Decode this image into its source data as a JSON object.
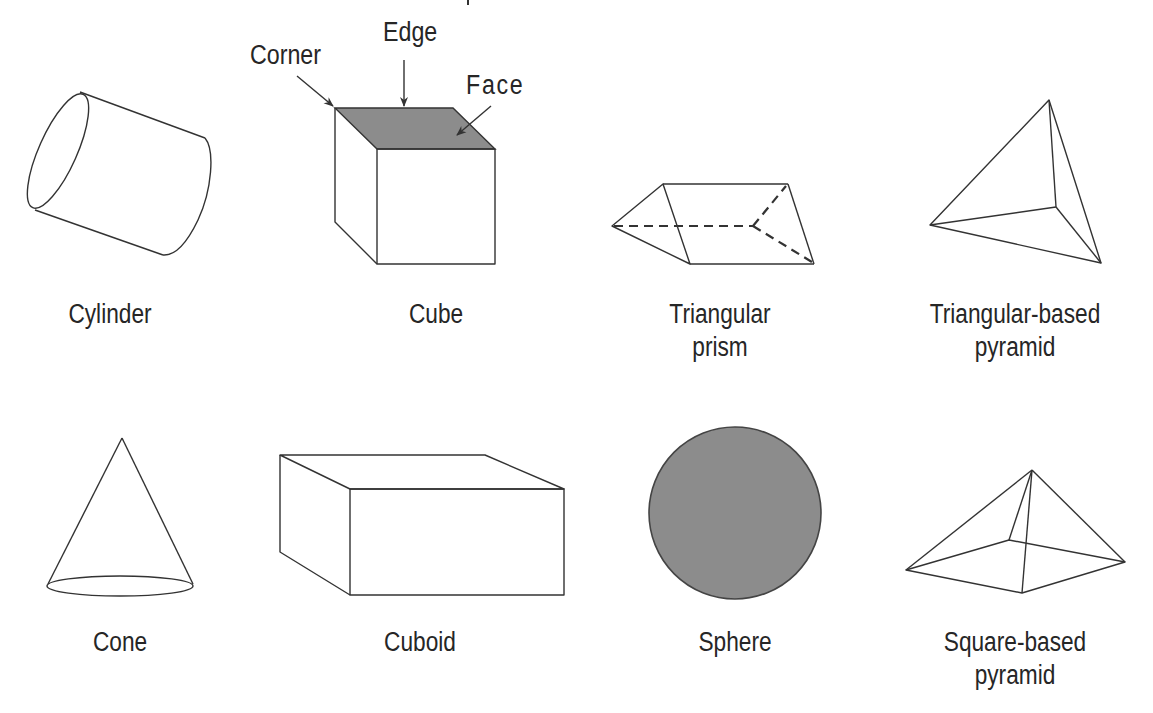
{
  "figure": {
    "colors": {
      "background": "#ffffff",
      "stroke": "#333333",
      "shaded_fill": "#8c8c8c",
      "text": "#262626"
    },
    "annotations": {
      "corner": "Corner",
      "edge": "Edge",
      "face": "Face"
    },
    "shapes": [
      {
        "id": "cylinder",
        "label_lines": [
          "Cylinder"
        ]
      },
      {
        "id": "cube",
        "label_lines": [
          "Cube"
        ]
      },
      {
        "id": "triangular-prism",
        "label_lines": [
          "Triangular",
          "prism"
        ]
      },
      {
        "id": "triangular-pyramid",
        "label_lines": [
          "Triangular-based",
          "pyramid"
        ]
      },
      {
        "id": "cone",
        "label_lines": [
          "Cone"
        ]
      },
      {
        "id": "cuboid",
        "label_lines": [
          "Cuboid"
        ]
      },
      {
        "id": "sphere",
        "label_lines": [
          "Sphere"
        ]
      },
      {
        "id": "square-pyramid",
        "label_lines": [
          "Square-based",
          "pyramid"
        ]
      }
    ]
  }
}
